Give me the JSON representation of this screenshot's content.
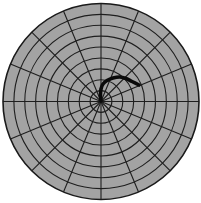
{
  "diagram": {
    "type": "polar-grid",
    "canvas": {
      "width": 201,
      "height": 203
    },
    "center": {
      "x": 101,
      "y": 101.5
    },
    "outer_radius": 98,
    "ring_count": 9,
    "spoke_count": 16,
    "spoke_step_deg": 22.5,
    "colors": {
      "background": "#ffffff",
      "fill": "#a3a3a3",
      "grid_line": "#1e1e1e",
      "outline": "#1a1a1a",
      "path": "#0a0a0a"
    },
    "line_widths": {
      "grid": 1.1,
      "outline": 1.6,
      "path": 3.6
    },
    "path": {
      "description": "thick dark curve starting at center, rising up then arcing to the right",
      "points": [
        [
          101,
          101
        ],
        [
          100.5,
          95
        ],
        [
          101,
          89
        ],
        [
          103,
          84
        ],
        [
          107,
          80.5
        ],
        [
          113,
          78
        ],
        [
          120,
          77
        ],
        [
          126,
          78.5
        ],
        [
          132,
          81.5
        ],
        [
          139,
          85
        ]
      ]
    }
  }
}
